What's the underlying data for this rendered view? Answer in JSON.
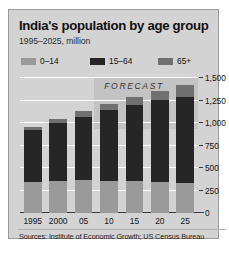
{
  "chart_data": {
    "type": "bar",
    "title": "India's population by age group",
    "subtitle": "1995–2025, million",
    "xlabel": "",
    "ylabel": "",
    "categories": [
      "1995",
      "2000",
      "05",
      "10",
      "15",
      "20",
      "25"
    ],
    "series": [
      {
        "name": "0–14",
        "color": "#9a9a9a",
        "values": [
          345,
          360,
          365,
          360,
          350,
          340,
          330
        ]
      },
      {
        "name": "15–64",
        "color": "#262626",
        "values": [
          575,
          640,
          705,
          780,
          855,
          915,
          960
        ]
      },
      {
        "name": "65+",
        "color": "#707070",
        "values": [
          40,
          50,
          60,
          70,
          85,
          105,
          130
        ]
      }
    ],
    "totals": [
      960,
      1050,
      1130,
      1210,
      1290,
      1360,
      1420
    ],
    "stacked": true,
    "ylim": [
      0,
      1500
    ],
    "yticks": [
      0,
      250,
      500,
      750,
      1000,
      1250,
      1500
    ],
    "ytick_labels": [
      "0",
      "250",
      "500",
      "750",
      "1,000",
      "1,250",
      "1,500"
    ],
    "grid": "horizontal",
    "legend_position": "top",
    "annotations": [
      {
        "text": "FORECAST",
        "from_category": "10",
        "to_category": "25"
      }
    ],
    "source": "Sources: Institute of Economic Growth; US Census Bureau"
  },
  "colors": {
    "panel_background": "#d3d3d3",
    "forecast_band": "#c3c3c3",
    "gridline": "#ffffff",
    "axis": "#3a3a3a",
    "title_text": "#101010",
    "body_text": "#141414"
  },
  "legend": {
    "items": [
      {
        "label": "0–14",
        "color": "#9a9a9a"
      },
      {
        "label": "15–64",
        "color": "#262626"
      },
      {
        "label": "65+",
        "color": "#707070"
      }
    ]
  },
  "forecast": {
    "label": "FORECAST"
  }
}
